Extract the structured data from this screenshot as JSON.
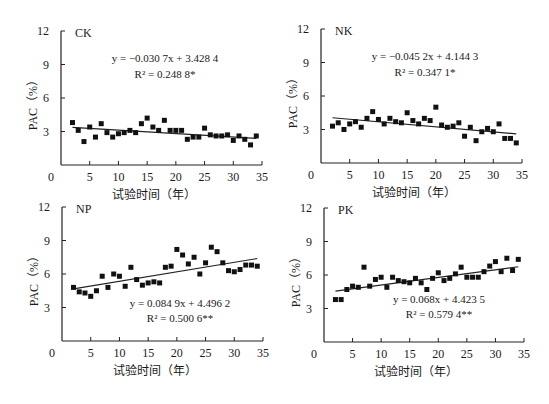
{
  "figure": {
    "xlabel": "试验时间（年）",
    "ylabel": "PAC（%）"
  },
  "chart_data": [
    {
      "type": "scatter",
      "panel": "CK",
      "title": "CK",
      "xlabel": "试验时间（年）",
      "ylabel": "PAC（%）",
      "xlim": [
        0,
        35
      ],
      "ylim": [
        0,
        12
      ],
      "xticks": [
        0,
        5,
        10,
        15,
        20,
        25,
        30,
        35
      ],
      "yticks": [
        0,
        3,
        6,
        9,
        12
      ],
      "grid": false,
      "equation": "y = −0.030 7x + 3.428 4",
      "r2": "R² = 0.248 8*",
      "trend": {
        "slope": -0.0307,
        "intercept": 3.4284,
        "x_range": [
          2,
          34
        ]
      },
      "x": [
        2,
        3,
        4,
        5,
        6,
        7,
        8,
        9,
        10,
        11,
        12,
        13,
        14,
        15,
        16,
        17,
        18,
        19,
        20,
        21,
        22,
        23,
        24,
        25,
        26,
        27,
        28,
        29,
        30,
        31,
        32,
        33,
        34
      ],
      "y": [
        3.8,
        3.1,
        2.1,
        3.4,
        2.5,
        3.7,
        2.9,
        2.5,
        2.8,
        2.9,
        3.1,
        2.9,
        3.7,
        4.2,
        3.4,
        3.1,
        4.0,
        3.1,
        3.1,
        3.1,
        2.3,
        2.5,
        2.5,
        3.3,
        2.7,
        2.6,
        2.6,
        2.7,
        2.2,
        2.6,
        2.3,
        1.8,
        2.6
      ]
    },
    {
      "type": "scatter",
      "panel": "NK",
      "title": "NK",
      "xlabel": "试验时间（年）",
      "ylabel": "PAC（%）",
      "xlim": [
        0,
        35
      ],
      "ylim": [
        0,
        12
      ],
      "xticks": [
        0,
        5,
        10,
        15,
        20,
        25,
        30,
        35
      ],
      "yticks": [
        0,
        3,
        6,
        9,
        12
      ],
      "grid": false,
      "equation": "y = −0.045 2x + 4.144 3",
      "r2": "R² = 0.347 1*",
      "trend": {
        "slope": -0.0452,
        "intercept": 4.1443,
        "x_range": [
          2,
          34
        ]
      },
      "x": [
        2,
        3,
        4,
        5,
        6,
        7,
        8,
        9,
        10,
        11,
        12,
        13,
        14,
        15,
        16,
        17,
        18,
        19,
        20,
        21,
        22,
        23,
        24,
        25,
        26,
        27,
        28,
        29,
        30,
        31,
        32,
        33,
        34
      ],
      "y": [
        3.3,
        3.6,
        3.0,
        3.5,
        3.7,
        3.2,
        4.0,
        4.6,
        3.9,
        3.5,
        4.0,
        3.7,
        3.6,
        4.5,
        3.8,
        3.5,
        4.0,
        3.8,
        5.0,
        3.4,
        3.2,
        3.3,
        3.6,
        2.4,
        3.2,
        2.0,
        2.8,
        3.1,
        2.8,
        3.5,
        2.2,
        2.2,
        1.8
      ]
    },
    {
      "type": "scatter",
      "panel": "NP",
      "title": "NP",
      "xlabel": "试验时间（年）",
      "ylabel": "PAC（%）",
      "xlim": [
        0,
        35
      ],
      "ylim": [
        0,
        12
      ],
      "xticks": [
        0,
        5,
        10,
        15,
        20,
        25,
        30,
        35
      ],
      "yticks": [
        0,
        3,
        6,
        9,
        12
      ],
      "grid": false,
      "equation": "y = 0.084 9x + 4.496 2",
      "r2": "R² = 0.500 6**",
      "trend": {
        "slope": 0.0849,
        "intercept": 4.4962,
        "x_range": [
          2,
          34
        ]
      },
      "x": [
        2,
        3,
        4,
        5,
        6,
        7,
        8,
        9,
        10,
        11,
        12,
        13,
        14,
        15,
        16,
        17,
        18,
        19,
        20,
        21,
        22,
        23,
        24,
        25,
        26,
        27,
        28,
        29,
        30,
        31,
        32,
        33,
        34
      ],
      "y": [
        4.8,
        4.4,
        4.3,
        4.0,
        4.5,
        5.8,
        4.8,
        6.0,
        5.8,
        4.9,
        6.6,
        5.5,
        5.0,
        5.2,
        5.3,
        5.2,
        6.6,
        6.7,
        8.2,
        7.7,
        6.9,
        7.5,
        6.0,
        7.0,
        8.4,
        8.0,
        7.0,
        6.3,
        6.2,
        6.4,
        6.8,
        6.8,
        6.7
      ]
    },
    {
      "type": "scatter",
      "panel": "PK",
      "title": "PK",
      "xlabel": "试验时间（年）",
      "ylabel": "PAC（%）",
      "xlim": [
        0,
        35
      ],
      "ylim": [
        0,
        12
      ],
      "xticks": [
        0,
        5,
        10,
        15,
        20,
        25,
        30,
        35
      ],
      "yticks": [
        0,
        3,
        6,
        9,
        12
      ],
      "grid": false,
      "equation": "y = 0.068x + 4.423 5",
      "r2": "R² = 0.579 4**",
      "trend": {
        "slope": 0.068,
        "intercept": 4.4235,
        "x_range": [
          2,
          34
        ]
      },
      "x": [
        2,
        3,
        4,
        5,
        6,
        7,
        8,
        9,
        10,
        11,
        12,
        13,
        14,
        15,
        16,
        17,
        18,
        19,
        20,
        21,
        22,
        23,
        24,
        25,
        26,
        27,
        28,
        29,
        30,
        31,
        32,
        33,
        34
      ],
      "y": [
        3.8,
        3.8,
        4.7,
        5.0,
        4.9,
        6.7,
        5.0,
        5.6,
        5.8,
        4.9,
        5.8,
        5.5,
        5.4,
        5.3,
        5.7,
        5.3,
        4.7,
        5.7,
        6.2,
        5.5,
        5.7,
        6.1,
        6.7,
        5.8,
        5.8,
        5.8,
        6.3,
        6.8,
        7.2,
        6.3,
        7.5,
        6.4,
        7.4
      ]
    }
  ],
  "panels_layout": [
    {
      "ox": 61,
      "oy": 165,
      "w": 201,
      "h": 134,
      "eq_x": 165,
      "eq_y": 62,
      "r2_x": 165,
      "r2_y": 78
    },
    {
      "ox": 321,
      "oy": 163,
      "w": 201,
      "h": 134,
      "eq_x": 425,
      "eq_y": 60,
      "r2_x": 425,
      "r2_y": 76
    },
    {
      "ox": 62,
      "oy": 341,
      "w": 201,
      "h": 134,
      "eq_x": 180,
      "eq_y": 307,
      "r2_x": 180,
      "r2_y": 322
    },
    {
      "ox": 324,
      "oy": 342,
      "w": 200,
      "h": 134,
      "eq_x": 439,
      "eq_y": 303,
      "r2_x": 439,
      "r2_y": 318
    }
  ]
}
